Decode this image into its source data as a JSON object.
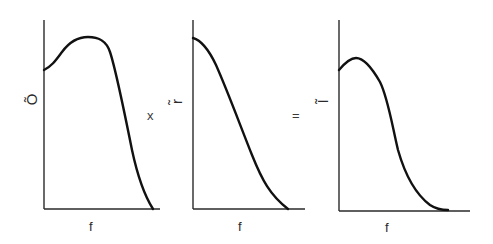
{
  "figure": {
    "operators": {
      "multiply": "x",
      "equals": "="
    },
    "plots": [
      {
        "id": "object-spectrum",
        "ylabel": "Õ",
        "xlabel": "f",
        "description": "Object spectrum: starts mid-height, rises to a broad peak, then falls steeply to zero"
      },
      {
        "id": "response-spectrum",
        "ylabel": "r̃",
        "xlabel": "f",
        "description": "Response/transfer function: starts at maximum and decreases monotonically to zero"
      },
      {
        "id": "image-spectrum",
        "ylabel": "Ĩ",
        "xlabel": "f",
        "description": "Image spectrum: product of the two, small peak then decays to zero"
      }
    ],
    "colors": {
      "ink": "#111111",
      "axis": "#2a2a2a",
      "background": "#ffffff"
    }
  }
}
